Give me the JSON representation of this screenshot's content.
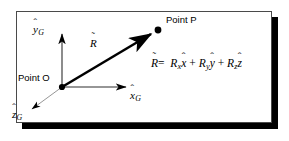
{
  "figure": {
    "background_color": "#ffffff",
    "frame_border_color": "#4a4a4a",
    "shadow_color": "#000000",
    "stroke_color": "#000000"
  },
  "labels": {
    "point_o": "Point O",
    "point_p": "Point P",
    "y_axis": {
      "base": "y",
      "hat": "ˆ",
      "subscript": "G"
    },
    "x_axis": {
      "base": "x",
      "hat": "ˆ",
      "subscript": "G"
    },
    "z_axis": {
      "base": "z",
      "hat": "ˆ",
      "subscript": "G"
    },
    "vector_r": {
      "base": "R",
      "hat": "˜"
    }
  },
  "equation": {
    "lhs": {
      "base": "R",
      "hat": "˜"
    },
    "equals": "=",
    "terms": [
      {
        "coefficient": "R",
        "coefficient_subscript": "x",
        "unit": "x",
        "unit_hat": "ˆ"
      },
      {
        "coefficient": "R",
        "coefficient_subscript": "y",
        "unit": "y",
        "unit_hat": "ˆ"
      },
      {
        "coefficient": "R",
        "coefficient_subscript": "z",
        "unit": "z",
        "unit_hat": "ˆ"
      }
    ],
    "operator": "+",
    "plain_text": "R = Rx x̂ + Ry ŷ + Rz ẑ"
  },
  "geometry": {
    "origin": {
      "x": 62,
      "y": 87
    },
    "point_p": {
      "x": 157,
      "y": 30
    },
    "y_axis_tip": {
      "x": 62,
      "y": 31
    },
    "x_axis_tip": {
      "x": 131,
      "y": 87
    },
    "z_axis_tip": {
      "x": 28,
      "y": 112
    }
  }
}
